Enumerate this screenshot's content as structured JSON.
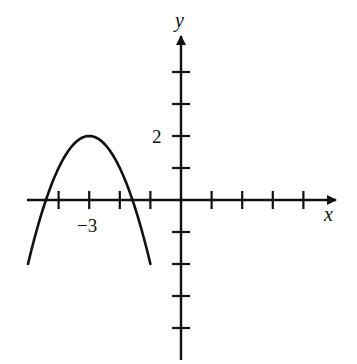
{
  "chart_data": {
    "type": "line",
    "title": "",
    "xlabel": "x",
    "ylabel": "y",
    "xlim": [
      -5,
      5
    ],
    "ylim": [
      -5,
      5
    ],
    "grid": false,
    "legend": null,
    "x_ticks": [
      -5,
      -4,
      -3,
      -2,
      -1,
      1,
      2,
      3,
      4
    ],
    "y_ticks": [
      -4,
      -3,
      -2,
      -1,
      1,
      2,
      3,
      4
    ],
    "labeled_ticks": {
      "x": [
        {
          "value": -3,
          "label": "−3"
        }
      ],
      "y": [
        {
          "value": 2,
          "label": "2"
        }
      ]
    },
    "series": [
      {
        "name": "parabola",
        "equation": "y = -(x + 3)^2 + 2",
        "vertex": [
          -3,
          2
        ],
        "domain": [
          -5,
          -1
        ],
        "x": [
          -5,
          -4.5,
          -4.414,
          -4,
          -3.5,
          -3,
          -2.5,
          -2,
          -1.586,
          -1.5,
          -1
        ],
        "values": [
          -2,
          -0.25,
          0,
          1,
          1.75,
          2,
          1.75,
          1,
          0,
          -0.25,
          -2
        ],
        "color": "#111111"
      }
    ]
  },
  "labels": {
    "x_axis": "x",
    "y_axis": "y",
    "tick_x_neg3": "−3",
    "tick_y_2": "2"
  },
  "colors": {
    "ink": "#111111",
    "background": "#ffffff"
  }
}
